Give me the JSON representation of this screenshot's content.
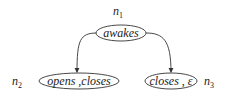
{
  "diagram": {
    "type": "tree",
    "nodes": [
      {
        "id": "n1",
        "name": "n",
        "sub": "1",
        "label": "awakes"
      },
      {
        "id": "n2",
        "name": "n",
        "sub": "2",
        "label": "opens ,closes"
      },
      {
        "id": "n3",
        "name": "n",
        "sub": "3",
        "label": "closes , ε"
      }
    ],
    "edges": [
      {
        "from": "n1",
        "to": "n2"
      },
      {
        "from": "n1",
        "to": "n3"
      }
    ]
  }
}
